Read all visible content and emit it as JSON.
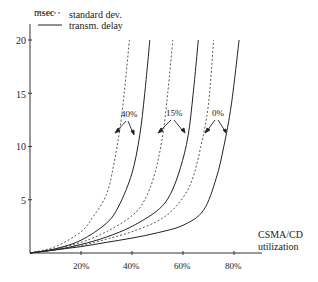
{
  "chart_data": {
    "type": "line",
    "title": "",
    "xlabel": "CSMA/CD utilization",
    "xlabel_lines": [
      "CSMA/CD",
      "utilization"
    ],
    "ylabel": "msec",
    "xlim": [
      0,
      85
    ],
    "ylim": [
      0,
      20
    ],
    "x_ticks": [
      "20%",
      "40%",
      "60%",
      "80%"
    ],
    "y_ticks": [
      "5",
      "10",
      "15",
      "20"
    ],
    "grid": false,
    "legend": {
      "position": "top-left",
      "entries": [
        {
          "label": "standard dev.",
          "style": "dashed"
        },
        {
          "label": "transm. delay",
          "style": "solid"
        }
      ]
    },
    "annotations": [
      "40%",
      "15%",
      "0%"
    ],
    "series": [
      {
        "name": "standard dev. (40%)",
        "style": "dashed",
        "x": [
          0,
          10,
          20,
          25,
          30,
          33,
          36,
          39
        ],
        "y": [
          0,
          0.6,
          2.0,
          3.5,
          5.5,
          8.5,
          13,
          20
        ]
      },
      {
        "name": "transm. delay (40%)",
        "style": "solid",
        "x": [
          0,
          10,
          20,
          30,
          35,
          40,
          43,
          45,
          47
        ],
        "y": [
          0,
          0.4,
          1.2,
          2.8,
          4.5,
          7.5,
          11,
          15,
          20
        ]
      },
      {
        "name": "standard dev. (15%)",
        "style": "dashed",
        "x": [
          0,
          10,
          20,
          30,
          40,
          45,
          49,
          52,
          54,
          56
        ],
        "y": [
          0,
          0.4,
          1.0,
          2.0,
          3.5,
          5.0,
          7.5,
          11,
          15,
          20
        ]
      },
      {
        "name": "transm. delay (15%)",
        "style": "solid",
        "x": [
          0,
          10,
          20,
          30,
          40,
          50,
          55,
          59,
          62,
          64,
          66
        ],
        "y": [
          0,
          0.3,
          0.8,
          1.5,
          2.5,
          4.0,
          5.5,
          8.0,
          11,
          15,
          20
        ]
      },
      {
        "name": "standard dev. (0%)",
        "style": "dashed",
        "x": [
          0,
          10,
          20,
          30,
          40,
          50,
          57,
          63,
          67,
          70,
          72
        ],
        "y": [
          0,
          0.3,
          0.7,
          1.3,
          2.0,
          3.0,
          4.3,
          6.5,
          10,
          14,
          20
        ]
      },
      {
        "name": "transm. delay (0%)",
        "style": "solid",
        "x": [
          0,
          10,
          20,
          30,
          40,
          50,
          60,
          68,
          73,
          76,
          79,
          82
        ],
        "y": [
          0,
          0.3,
          0.6,
          1.0,
          1.4,
          1.9,
          2.6,
          4.0,
          7.0,
          10,
          14,
          20
        ]
      }
    ]
  }
}
